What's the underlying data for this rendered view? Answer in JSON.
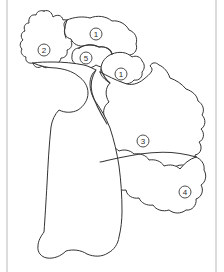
{
  "diagram": {
    "type": "line-art-map",
    "background_color": "#ffffff",
    "stroke_color": "#3a3a3a",
    "frame_color": "#b9b9b9",
    "label_style": "circled-number"
  },
  "frame": {
    "left_border_x": 7,
    "right_border_x": 216,
    "visible": true
  },
  "regions": [
    {
      "id": "region-2",
      "label": "2",
      "label_cx": 44,
      "label_cy": 50,
      "label_r": 6,
      "description": "upper-left lobed region"
    },
    {
      "id": "region-1-upper",
      "label": "1",
      "label_cx": 96,
      "label_cy": 34,
      "label_r": 6,
      "description": "upper-middle region"
    },
    {
      "id": "region-5",
      "label": "5",
      "label_cx": 86,
      "label_cy": 58,
      "label_r": 6,
      "description": "small enclosed central-top region"
    },
    {
      "id": "region-1-right",
      "label": "1",
      "label_cx": 121,
      "label_cy": 74,
      "label_r": 6,
      "description": "upper-right region"
    },
    {
      "id": "region-3",
      "label": "3",
      "label_cx": 143,
      "label_cy": 141,
      "label_r": 6,
      "description": "large central-right region"
    },
    {
      "id": "region-4",
      "label": "4",
      "label_cx": 185,
      "label_cy": 192,
      "label_r": 6,
      "description": "lower-right boot-shaped region"
    }
  ],
  "labels_sequence": [
    "2",
    "1",
    "5",
    "1",
    "3",
    "4"
  ],
  "region_count": 6
}
